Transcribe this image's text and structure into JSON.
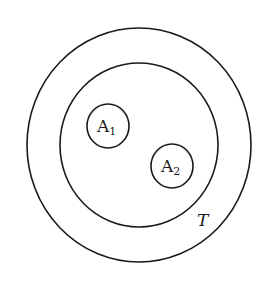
{
  "diagram": {
    "type": "nested-set-diagram",
    "outer_set": {
      "label": ""
    },
    "inner_set": {
      "label": "T"
    },
    "subsets": [
      {
        "label": "A",
        "subscript": "1"
      },
      {
        "label": "A",
        "subscript": "2"
      }
    ],
    "colors": {
      "stroke": "#1a1a1a",
      "background": "#ffffff"
    }
  }
}
